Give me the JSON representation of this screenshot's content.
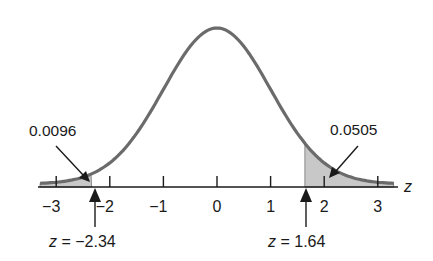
{
  "chart_data": {
    "type": "area",
    "title": "",
    "xlabel": "z",
    "ylabel": "",
    "xlim": [
      -3.3,
      3.3
    ],
    "x_ticks": [
      -3,
      -2,
      -1,
      0,
      1,
      2,
      3
    ],
    "x_tick_labels": [
      "−3",
      "−2",
      "−1",
      "0",
      "1",
      "2",
      "3"
    ],
    "grid": false,
    "series": [
      {
        "name": "standard normal pdf",
        "mean": 0,
        "sd": 1
      }
    ],
    "shaded_regions": [
      {
        "from": -3.3,
        "to": -2.34,
        "area": 0.0096,
        "label": "0.0096"
      },
      {
        "from": 1.64,
        "to": 3.3,
        "area": 0.0505,
        "label": "0.0505"
      }
    ],
    "annotations": [
      {
        "text": "z = −2.34",
        "x": -2.34
      },
      {
        "text": "z = 1.64",
        "x": 1.64
      }
    ]
  },
  "labels": {
    "left_area": "0.0096",
    "right_area": "0.0505",
    "left_z": "z = −2.34",
    "right_z": "z = 1.64",
    "axis_var": "z",
    "ticks": [
      "−3",
      "−2",
      "−1",
      "0",
      "1",
      "2",
      "3"
    ]
  },
  "colors": {
    "curve": "#6b6b6b",
    "shade": "#c8c8c8",
    "axis": "#1a1a1a"
  }
}
